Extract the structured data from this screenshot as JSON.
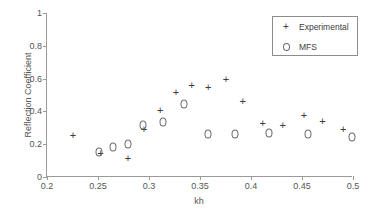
{
  "chart_data": {
    "type": "scatter",
    "title": "",
    "xlabel": "kh",
    "ylabel": "Reflection Coefficient",
    "xlim": [
      0.2,
      0.5
    ],
    "ylim": [
      0,
      1
    ],
    "xticks": [
      "0.2",
      "0.25",
      "0.3",
      "0.35",
      "0.4",
      "0.45",
      "0.5"
    ],
    "xtick_values": [
      0.2,
      0.25,
      0.3,
      0.35,
      0.4,
      0.45,
      0.5
    ],
    "yticks": [
      "0",
      "0.2",
      "0.4",
      "0.6",
      "0.8",
      "1"
    ],
    "ytick_values": [
      0,
      0.2,
      0.4,
      0.6,
      0.8,
      1
    ],
    "grid": false,
    "legend_position": "upper right",
    "series": [
      {
        "name": "Experimental",
        "marker": "plus",
        "color": "#3b3b3b",
        "points": [
          {
            "x": 0.2255,
            "y": 0.25
          },
          {
            "x": 0.2525,
            "y": 0.143
          },
          {
            "x": 0.2795,
            "y": 0.112
          },
          {
            "x": 0.295,
            "y": 0.285
          },
          {
            "x": 0.311,
            "y": 0.402
          },
          {
            "x": 0.3265,
            "y": 0.512
          },
          {
            "x": 0.342,
            "y": 0.556
          },
          {
            "x": 0.358,
            "y": 0.54
          },
          {
            "x": 0.3755,
            "y": 0.594
          },
          {
            "x": 0.392,
            "y": 0.458
          },
          {
            "x": 0.4115,
            "y": 0.325
          },
          {
            "x": 0.431,
            "y": 0.308
          },
          {
            "x": 0.452,
            "y": 0.375
          },
          {
            "x": 0.47,
            "y": 0.335
          },
          {
            "x": 0.4905,
            "y": 0.285
          }
        ]
      },
      {
        "name": "MFS",
        "marker": "circle",
        "color": "#6b6b6b",
        "points": [
          {
            "x": 0.2505,
            "y": 0.15
          },
          {
            "x": 0.2645,
            "y": 0.18
          },
          {
            "x": 0.279,
            "y": 0.2
          },
          {
            "x": 0.2945,
            "y": 0.318
          },
          {
            "x": 0.3135,
            "y": 0.335
          },
          {
            "x": 0.3345,
            "y": 0.445
          },
          {
            "x": 0.3575,
            "y": 0.26
          },
          {
            "x": 0.3845,
            "y": 0.265
          },
          {
            "x": 0.418,
            "y": 0.27
          },
          {
            "x": 0.4555,
            "y": 0.265
          },
          {
            "x": 0.499,
            "y": 0.243
          }
        ]
      }
    ]
  },
  "legend": {
    "entries": [
      {
        "label": "Experimental",
        "marker": "plus"
      },
      {
        "label": "MFS",
        "marker": "circle"
      }
    ]
  }
}
